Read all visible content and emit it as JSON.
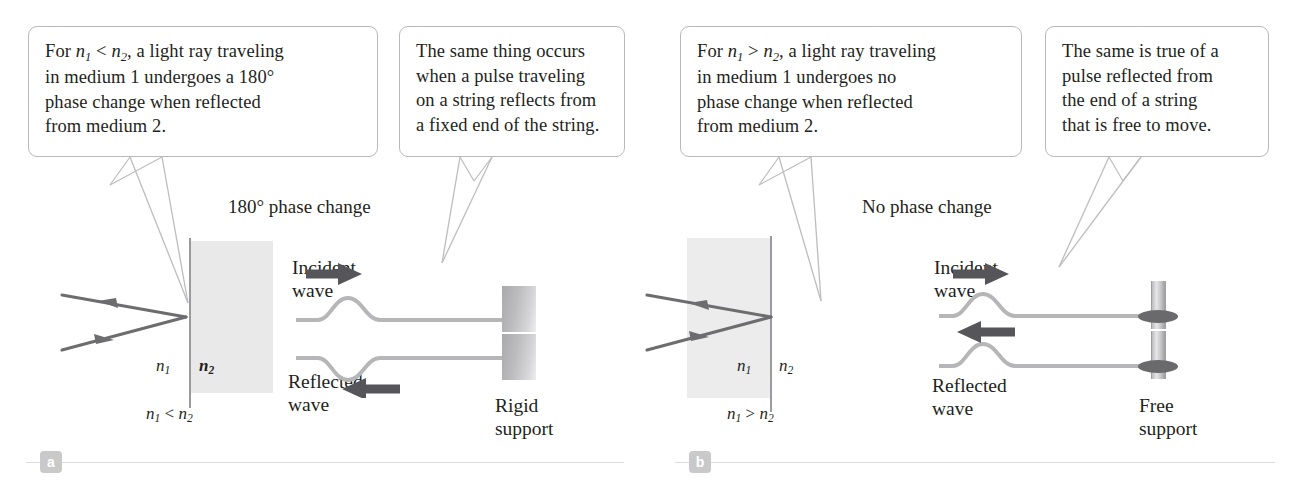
{
  "figure": {
    "colors": {
      "ray": "#6d6d70",
      "string": "#b6b6b8",
      "arrow": "#55555a",
      "medium_shade": "#e9e9e9",
      "callout_border": "#b9b9bb",
      "leader": "#bdbdbf",
      "badge_bg": "#c9c9c9",
      "rule": "#dcdcdc",
      "text": "#231f20"
    }
  },
  "panel_a": {
    "badge": "a",
    "heading": "180° phase change",
    "callout_optics": {
      "line1_a": "For ",
      "line1_n1": "n",
      "line1_sub1": "1",
      "line1_rel": " < ",
      "line1_n2": "n",
      "line1_sub2": "2",
      "line1_b": ", a light ray traveling",
      "line2": "in medium 1 undergoes a 180°",
      "line3": "phase change when reflected",
      "line4": "from medium 2."
    },
    "callout_string": {
      "line1": "The same thing occurs",
      "line2": "when a pulse traveling",
      "line3": "on a string reflects from",
      "line4": "a fixed end of the string."
    },
    "labels": {
      "n1": "n",
      "n1_sub": "1",
      "n2": "n",
      "n2_sub": "2",
      "relation_n": "n",
      "relation_sub1": "1",
      "relation_op": " < ",
      "relation_n2": "n",
      "relation_sub2": "2",
      "incident_line1": "Incident",
      "incident_line2": "wave",
      "reflected_line1": "Reflected",
      "reflected_line2": "wave",
      "support_line1": "Rigid",
      "support_line2": "support"
    },
    "pulse": {
      "incident_direction": "right",
      "reflected_direction": "left",
      "incident_polarity": "up",
      "reflected_polarity": "down"
    },
    "shaded_side": "right"
  },
  "panel_b": {
    "badge": "b",
    "heading": "No phase change",
    "callout_optics": {
      "line1_a": "For ",
      "line1_n1": "n",
      "line1_sub1": "1",
      "line1_rel": " > ",
      "line1_n2": "n",
      "line1_sub2": "2",
      "line1_b": ", a light ray traveling",
      "line2": "in medium 1 undergoes no",
      "line3": "phase change when reflected",
      "line4": "from medium 2."
    },
    "callout_string": {
      "line1": "The same is true of a",
      "line2": "pulse reflected from",
      "line3": "the end of a string",
      "line4": "that is free to move."
    },
    "labels": {
      "n1": "n",
      "n1_sub": "1",
      "n2": "n",
      "n2_sub": "2",
      "relation_n": "n",
      "relation_sub1": "1",
      "relation_op": " > ",
      "relation_n2": "n",
      "relation_sub2": "2",
      "incident_line1": "Incident",
      "incident_line2": "wave",
      "reflected_line1": "Reflected",
      "reflected_line2": "wave",
      "support_line1": "Free",
      "support_line2": "support"
    },
    "pulse": {
      "incident_direction": "right",
      "reflected_direction": "left",
      "incident_polarity": "up",
      "reflected_polarity": "up"
    },
    "shaded_side": "left"
  }
}
